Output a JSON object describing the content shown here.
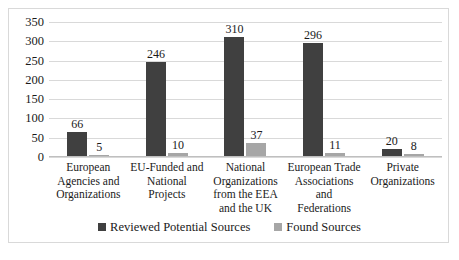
{
  "chart_data": {
    "type": "bar",
    "title": "",
    "xlabel": "",
    "ylabel": "",
    "ylim": [
      0,
      350
    ],
    "ytick_step": 50,
    "yticks": [
      350,
      300,
      250,
      200,
      150,
      100,
      50,
      0
    ],
    "grid": true,
    "legend_position": "bottom-center",
    "categories": [
      "European Agencies and Organizations",
      "EU-Funded and National Projects",
      "National Organizations from the EEA and the UK",
      "European Trade Associations and Federations",
      "Private Organizations"
    ],
    "category_lines": [
      [
        "European",
        "Agencies and",
        "Organizations"
      ],
      [
        "EU-Funded and",
        "National",
        "Projects"
      ],
      [
        "National",
        "Organizations",
        "from the EEA",
        "and the UK"
      ],
      [
        "European Trade",
        "Associations and",
        "Federations"
      ],
      [
        "Private",
        "Organizations"
      ]
    ],
    "series": [
      {
        "name": "Reviewed Potential Sources",
        "color": "#404040",
        "values": [
          66,
          246,
          310,
          296,
          20
        ]
      },
      {
        "name": "Found Sources",
        "color": "#a6a6a6",
        "values": [
          5,
          10,
          37,
          11,
          8
        ]
      }
    ]
  },
  "legend": {
    "items": [
      {
        "label": "Reviewed Potential Sources",
        "swatch": "legend-swatch-dark"
      },
      {
        "label": "Found Sources",
        "swatch": "legend-swatch-light"
      }
    ]
  }
}
